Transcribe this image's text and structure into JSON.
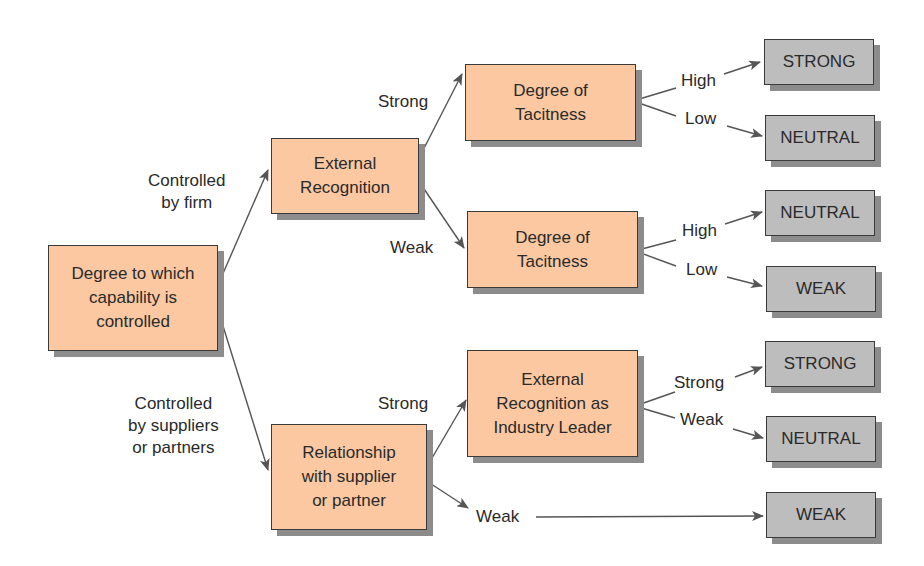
{
  "nodes": {
    "root": "Degree to which\ncapability is\ncontrolled",
    "ext_rec": "External\nRecognition",
    "tac1": "Degree of\nTacitness",
    "tac2": "Degree of\nTacitness",
    "rel": "Relationship\nwith supplier\nor partner",
    "ext_lead": "External\nRecognition as\nIndustry Leader"
  },
  "outcomes": [
    "STRONG",
    "NEUTRAL",
    "NEUTRAL",
    "WEAK",
    "STRONG",
    "NEUTRAL",
    "WEAK"
  ],
  "edge_labels": {
    "by_firm": "Controlled\nby firm",
    "by_suppliers": "Controlled\nby suppliers\nor partners",
    "er_strong": "Strong",
    "er_weak": "Weak",
    "t1_high": "High",
    "t1_low": "Low",
    "t2_high": "High",
    "t2_low": "Low",
    "rel_strong": "Strong",
    "rel_weak": "Weak",
    "lead_strong": "Strong",
    "lead_weak": "Weak"
  },
  "colors": {
    "decision_box": "#fbc8a2",
    "outcome_box": "#bdbdbd",
    "shadow": "#8c8c8c"
  }
}
